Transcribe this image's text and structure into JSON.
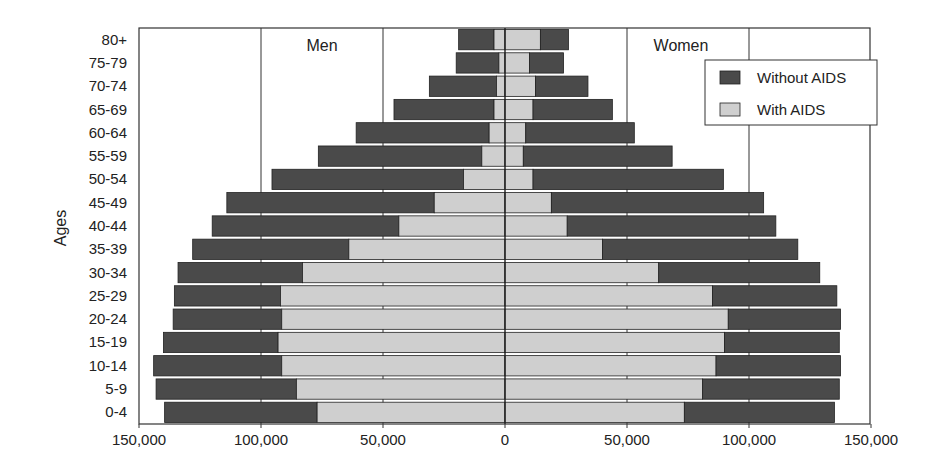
{
  "chart_data": {
    "type": "bar",
    "orientation": "horizontal-population-pyramid",
    "title": "",
    "xlabel": "",
    "ylabel": "Ages",
    "xlim": [
      -150000,
      150000
    ],
    "x_ticks": [
      -150000,
      -100000,
      -50000,
      0,
      50000,
      100000,
      150000
    ],
    "x_tick_labels": [
      "150,000",
      "100,000",
      "50,000",
      "0",
      "50,000",
      "100,000",
      "150,000"
    ],
    "panel_labels": {
      "left": "Men",
      "right": "Women"
    },
    "legend": {
      "position": "upper-right",
      "entries": [
        {
          "name": "Without AIDS",
          "color": "#4a4a4a"
        },
        {
          "name": "With AIDS",
          "color": "#cfcfcf"
        }
      ]
    },
    "grid": {
      "vertical_lines_at": [
        -100000,
        -50000,
        0,
        50000,
        100000
      ]
    },
    "categories": [
      "80+",
      "75-79",
      "70-74",
      "65-69",
      "60-64",
      "55-59",
      "50-54",
      "45-49",
      "40-44",
      "35-39",
      "30-34",
      "25-29",
      "20-24",
      "15-19",
      "10-14",
      "5-9",
      "0-4"
    ],
    "series": [
      {
        "name": "Men - Without AIDS",
        "side": "left",
        "values": [
          19000,
          20000,
          31000,
          45500,
          61000,
          76500,
          95500,
          114000,
          120000,
          128000,
          134000,
          135500,
          136000,
          140000,
          144000,
          143000,
          139500
        ]
      },
      {
        "name": "Men - With AIDS",
        "side": "left",
        "values": [
          4500,
          2500,
          3500,
          4500,
          6500,
          9500,
          17000,
          29000,
          43500,
          64000,
          83000,
          92000,
          91500,
          93000,
          91500,
          85500,
          77000
        ]
      },
      {
        "name": "Women - Without AIDS",
        "side": "right",
        "values": [
          26000,
          24000,
          34000,
          44000,
          53000,
          68500,
          89500,
          106000,
          111000,
          120000,
          129000,
          136000,
          137500,
          137000,
          137500,
          137000,
          135000
        ]
      },
      {
        "name": "Women - With AIDS",
        "side": "right",
        "values": [
          14500,
          10000,
          12500,
          11500,
          8500,
          7500,
          11500,
          19000,
          25500,
          40000,
          63000,
          85000,
          91500,
          90000,
          86500,
          81000,
          73500
        ]
      }
    ]
  },
  "colors": {
    "without_aids": "#4a4a4a",
    "with_aids": "#cfcfcf",
    "frame": "#333333",
    "background": "#ffffff"
  }
}
